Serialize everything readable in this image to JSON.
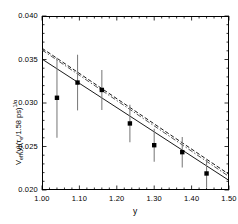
{
  "chart_data": {
    "type": "scatter",
    "title": "",
    "xlabel": "y",
    "ylabel": "V_eff(y)(τ_e/1.58 ps)^(1/α)",
    "xlim": [
      1.0,
      1.5
    ],
    "ylim": [
      0.02,
      0.04
    ],
    "grid": false,
    "legend": "none",
    "x_ticks": [
      "1.00",
      "1.10",
      "1.20",
      "1.30",
      "1.40",
      "1.50"
    ],
    "x_tick_values": [
      1.0,
      1.1,
      1.2,
      1.3,
      1.4,
      1.5
    ],
    "y_ticks": [
      "0.040",
      "0.035",
      "0.030",
      "0.025",
      "0.020"
    ],
    "y_tick_values": [
      0.04,
      0.035,
      0.03,
      0.025,
      0.02
    ],
    "x_minor_per_major": 5,
    "y_minor_per_major": 5,
    "marker": "filled-square",
    "marker_color": "#000000",
    "errorbar_color": "#808080",
    "points": [
      {
        "x": 1.04,
        "y": 0.0306,
        "yerr": 0.0046
      },
      {
        "x": 1.095,
        "y": 0.03235,
        "yerr": 0.0032
      },
      {
        "x": 1.16,
        "y": 0.0315,
        "yerr": 0.0023
      },
      {
        "x": 1.235,
        "y": 0.02765,
        "yerr": 0.00215
      },
      {
        "x": 1.3,
        "y": 0.02515,
        "yerr": 0.0019
      },
      {
        "x": 1.375,
        "y": 0.02435,
        "yerr": 0.00175
      },
      {
        "x": 1.44,
        "y": 0.0219,
        "yerr": 0.0016
      }
    ],
    "series": [
      {
        "name": "fit-solid",
        "style": "solid",
        "color": "#000000",
        "x": [
          1.0,
          1.5
        ],
        "values": [
          0.03505,
          0.0211
        ]
      },
      {
        "name": "fit-dashed",
        "style": "dashed",
        "color": "#000000",
        "x": [
          1.0,
          1.5
        ],
        "values": [
          0.0363,
          0.0218
        ]
      },
      {
        "name": "fit-dashdot",
        "style": "dashdot",
        "color": "#404040",
        "x": [
          1.0,
          1.5
        ],
        "values": [
          0.0361,
          0.02155
        ]
      }
    ]
  }
}
